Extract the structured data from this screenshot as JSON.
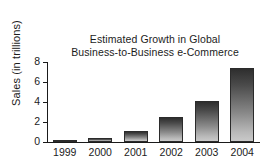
{
  "chart_data": {
    "type": "bar",
    "title": "Estimated Growth in Global Business-to-Business e-Commerce",
    "title_lines": [
      "Estimated Growth in Global",
      "Business-to-Business e-Commerce"
    ],
    "xlabel": "",
    "ylabel": "Sales (in trillions)",
    "categories": [
      "1999",
      "2000",
      "2001",
      "2002",
      "2003",
      "2004"
    ],
    "values": [
      0.15,
      0.45,
      1.1,
      2.5,
      4.15,
      7.45
    ],
    "ylim": [
      0,
      8
    ],
    "yticks": [
      0,
      2,
      4,
      6,
      8
    ],
    "ytick_labels": [
      "0",
      "2",
      "4",
      "6",
      "8"
    ],
    "grid": false,
    "legend": false,
    "bar_color_top": "#2e2e2e",
    "bar_color_bottom": "#c9c9c9",
    "bar_outline": "#2b2b2b",
    "axis_color": "#1a1a1a",
    "background": "#ffffff"
  }
}
